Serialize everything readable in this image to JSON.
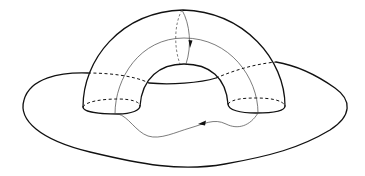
{
  "figure": {
    "colors": {
      "background": "#ffffff",
      "stroke": "#111111",
      "thin_stroke": "#444444"
    },
    "elements": [
      {
        "name": "base-surface-outline",
        "style": "thick solid"
      },
      {
        "name": "handle-outer-arc",
        "style": "thick solid"
      },
      {
        "name": "handle-inner-arc",
        "style": "thick solid"
      },
      {
        "name": "handle-left-foot",
        "style": "thick solid front, dashed back"
      },
      {
        "name": "handle-right-foot",
        "style": "thick solid front, dashed back"
      },
      {
        "name": "attachment-curve",
        "style": "solid front, dashed hidden"
      },
      {
        "name": "meridian-loop",
        "style": "thin, dashed back half",
        "arrow": "down"
      },
      {
        "name": "longitude-loop",
        "style": "thin",
        "arrow": "left"
      }
    ]
  }
}
